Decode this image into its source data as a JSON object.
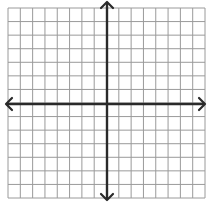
{
  "diagram": {
    "type": "coordinate-plane",
    "grid": {
      "columns": 16,
      "rows": 14,
      "left": 8,
      "top": 8,
      "right": 205,
      "bottom": 198,
      "line_color": "#9a9a9a",
      "background": "#ffffff"
    },
    "axes": {
      "x_axis_y": 104,
      "y_axis_x": 107,
      "color": "#2a2a2a",
      "x_axis": {
        "from": 6,
        "to": 205,
        "arrows": "both"
      },
      "y_axis": {
        "from": 2,
        "to": 200,
        "arrows": "both"
      }
    }
  }
}
